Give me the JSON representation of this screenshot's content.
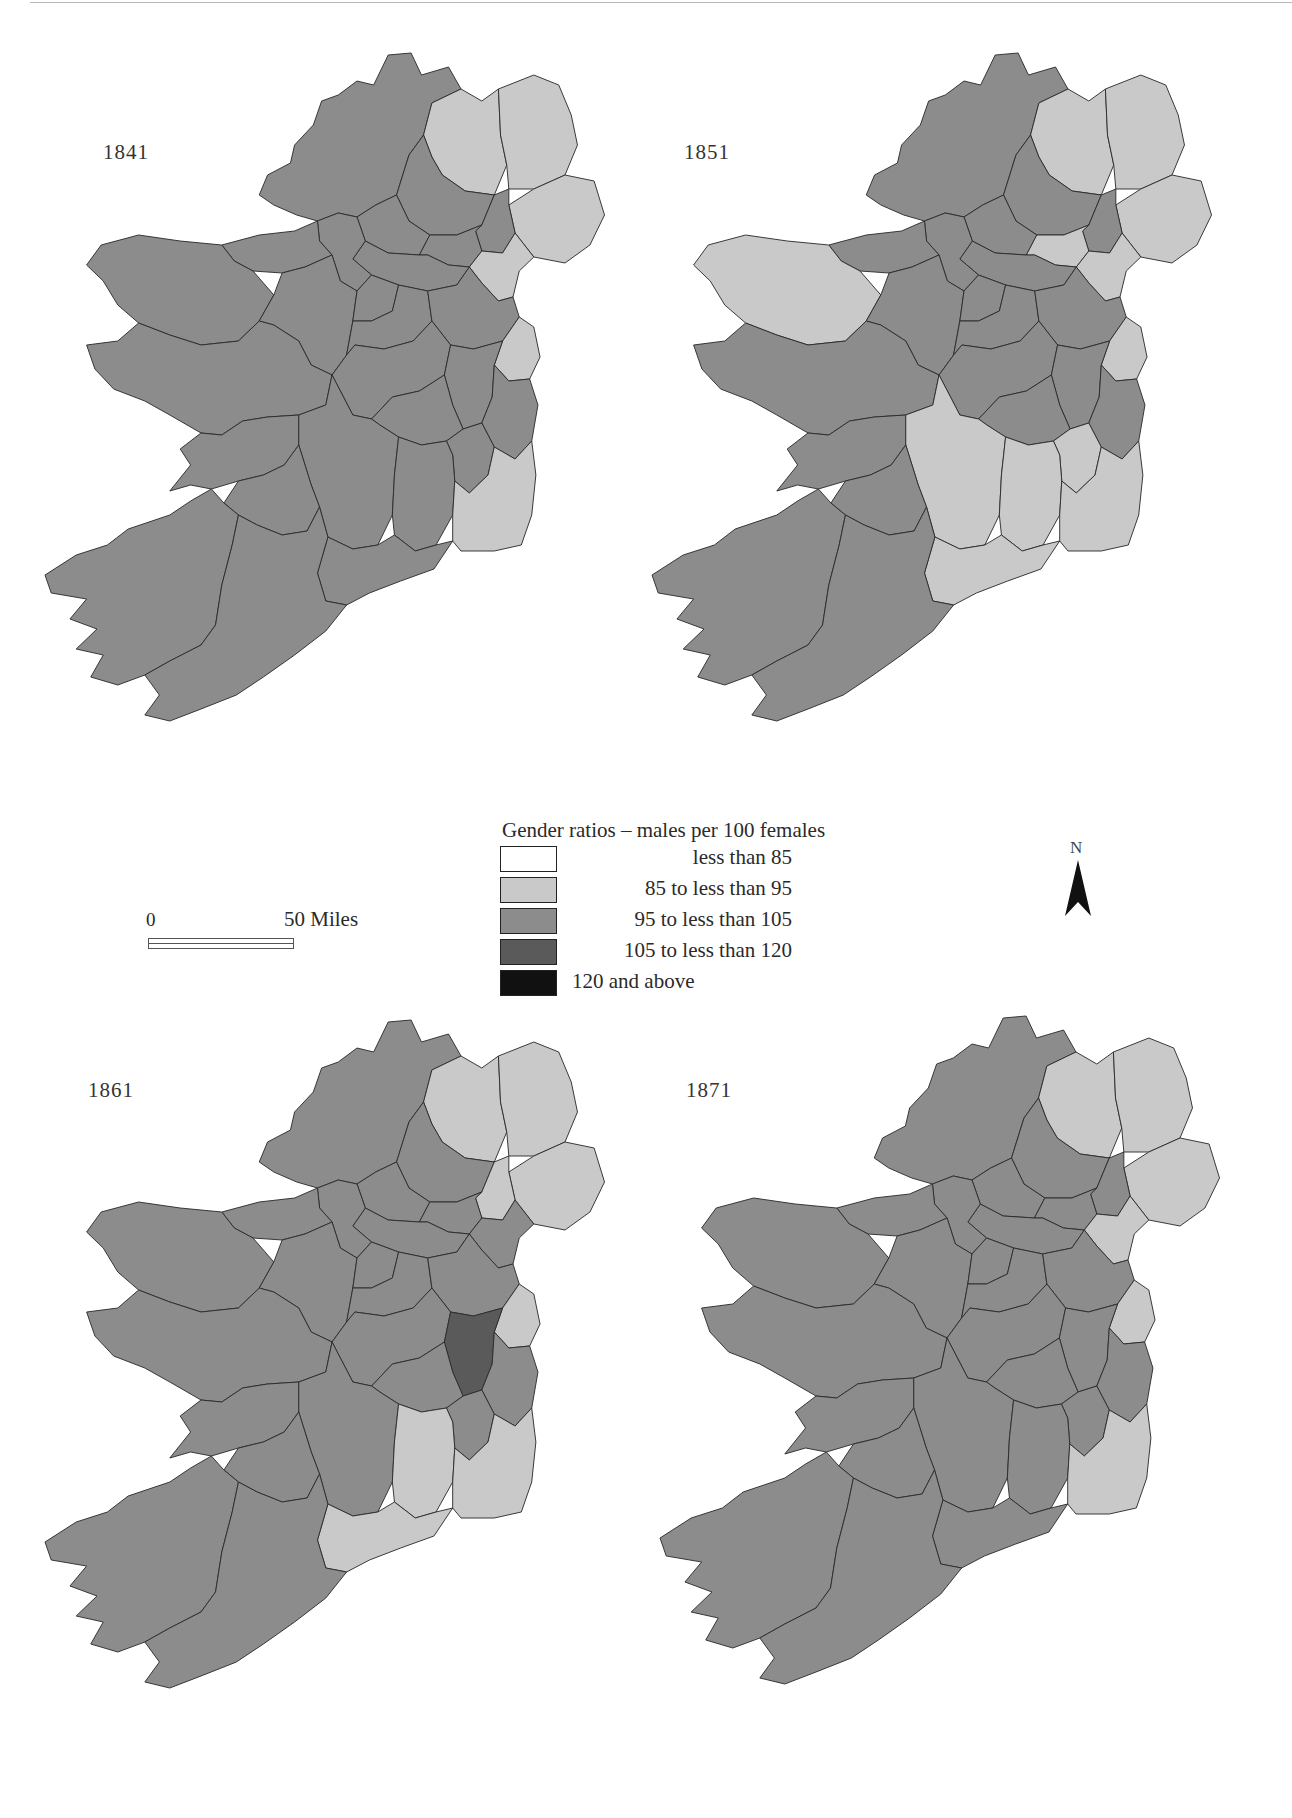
{
  "figure": {
    "maps": [
      {
        "year": "1841",
        "offset": [
          45,
          45
        ],
        "counties": {
          "derry": "c2",
          "antrim": "c2",
          "down": "c2",
          "louth": "c2",
          "dublin": "c2",
          "wexford": "c2"
        }
      },
      {
        "year": "1851",
        "offset": [
          652,
          45
        ],
        "counties": {
          "mayo": "c2",
          "derry": "c2",
          "antrim": "c2",
          "down": "c2",
          "monaghan": "c2",
          "louth": "c2",
          "dublin": "c2",
          "tipperary": "c2",
          "kilkenny": "c2",
          "carlow": "c2",
          "wexford": "c2",
          "waterford": "c2"
        }
      },
      {
        "year": "1861",
        "offset": [
          45,
          1012
        ],
        "counties": {
          "derry": "c2",
          "antrim": "c2",
          "armagh": "c2",
          "down": "c2",
          "dublin": "c2",
          "kilkenny": "c2",
          "wexford": "c2",
          "waterford": "c2",
          "kildare": "c4"
        }
      },
      {
        "year": "1871",
        "offset": [
          660,
          1008
        ],
        "counties": {
          "derry": "c2",
          "antrim": "c2",
          "down": "c2",
          "louth": "c2",
          "dublin": "c2",
          "wexford": "c2"
        }
      }
    ],
    "default_class": "c3"
  },
  "legend": {
    "title": "Gender ratios – males per 100 females",
    "items": [
      {
        "key": "c1",
        "label": "less than   85",
        "color": "#ffffff",
        "align": "right"
      },
      {
        "key": "c2",
        "label": "85 to less than   95",
        "color": "#c9c9c9",
        "align": "right"
      },
      {
        "key": "c3",
        "label": "95 to less than 105",
        "color": "#8c8c8c",
        "align": "right"
      },
      {
        "key": "c4",
        "label": "105 to less than 120",
        "color": "#5a5a5a",
        "align": "right"
      },
      {
        "key": "c5",
        "label": "120 and above",
        "color": "#111111",
        "align": "left"
      }
    ]
  },
  "scale_bar": {
    "start": "0",
    "end": "50 Miles"
  },
  "north_arrow": {
    "label": "N"
  },
  "chart_data": {
    "type": "choropleth",
    "title": "Gender ratios – males per 100 females",
    "classes": [
      "less than 85",
      "85 to less than 95",
      "95 to less than 105",
      "105 to less than 120",
      "120 and above"
    ],
    "years": [
      "1841",
      "1851",
      "1861",
      "1871"
    ],
    "non_default_counties": {
      "1841": {
        "85 to less than 95": [
          "Londonderry",
          "Antrim",
          "Down",
          "Louth",
          "Dublin",
          "Wexford"
        ]
      },
      "1851": {
        "85 to less than 95": [
          "Mayo",
          "Londonderry",
          "Antrim",
          "Down",
          "Monaghan",
          "Louth",
          "Dublin",
          "Tipperary",
          "Kilkenny",
          "Carlow",
          "Wexford",
          "Waterford"
        ]
      },
      "1861": {
        "85 to less than 95": [
          "Londonderry",
          "Antrim",
          "Armagh",
          "Down",
          "Dublin",
          "Kilkenny",
          "Wexford",
          "Waterford"
        ],
        "105 to less than 120": [
          "Kildare"
        ]
      },
      "1871": {
        "85 to less than 95": [
          "Londonderry",
          "Antrim",
          "Down",
          "Louth",
          "Dublin",
          "Wexford"
        ]
      }
    },
    "default_class": "95 to less than 105",
    "scale": "0–50 Miles"
  }
}
